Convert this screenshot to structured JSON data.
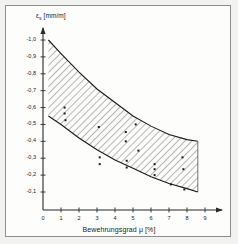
{
  "figure": {
    "background_color": "#f2f2f0",
    "panel_color": "#fdfdfc",
    "border_color": "#8e8e8e"
  },
  "chart_data": {
    "type": "scatter",
    "title": "",
    "subtitle": "",
    "xlabel": "Bewehrungsgrad μ [%]",
    "ylabel": "εs [mm/m]",
    "ylabel_symbol": "ε",
    "ylabel_subscript": "s",
    "ylabel_unit": "[mm/m]",
    "xlabel_text": "Bewehrungsgrad",
    "xlabel_symbol": "μ",
    "xlabel_unit": "[%]",
    "grid": false,
    "legend": "none",
    "xlim": [
      0,
      9.5
    ],
    "ylim": [
      -1.05,
      0
    ],
    "xticks": [
      0,
      1,
      2,
      3,
      4,
      5,
      6,
      7,
      8,
      9
    ],
    "xtick_labels": [
      "0",
      "1",
      "2",
      "3",
      "4",
      "5",
      "6",
      "7",
      "8",
      "9"
    ],
    "yticks": [
      -1.0,
      -0.9,
      -0.8,
      -0.7,
      -0.6,
      -0.5,
      -0.4,
      -0.3,
      -0.2,
      -0.1
    ],
    "ytick_labels": [
      "-1,0",
      "-0,9",
      "-0,8",
      "-0,7",
      "-0,6",
      "-0,5",
      "-0,4",
      "-0,3",
      "-0,2",
      "-0,1"
    ],
    "axis_arrows": true,
    "bands": [
      {
        "name": "scatter-band",
        "fill": "hatched",
        "hatch_angle": 45,
        "hatch_color": "#4a4a4a",
        "upper_curve": [
          [
            0.3,
            -1.0
          ],
          [
            1.0,
            -0.92
          ],
          [
            2.0,
            -0.81
          ],
          [
            3.0,
            -0.71
          ],
          [
            4.0,
            -0.63
          ],
          [
            5.0,
            -0.55
          ],
          [
            6.0,
            -0.49
          ],
          [
            7.0,
            -0.44
          ],
          [
            8.0,
            -0.41
          ],
          [
            8.6,
            -0.4
          ]
        ],
        "lower_curve": [
          [
            0.3,
            -0.55
          ],
          [
            1.0,
            -0.5
          ],
          [
            2.0,
            -0.42
          ],
          [
            3.0,
            -0.35
          ],
          [
            4.0,
            -0.29
          ],
          [
            5.0,
            -0.24
          ],
          [
            6.0,
            -0.19
          ],
          [
            7.0,
            -0.15
          ],
          [
            8.0,
            -0.12
          ],
          [
            8.6,
            -0.1
          ]
        ]
      }
    ],
    "points": [
      [
        1.2,
        -0.6
      ],
      [
        1.2,
        -0.565
      ],
      [
        1.25,
        -0.525
      ],
      [
        3.1,
        -0.485
      ],
      [
        3.15,
        -0.305
      ],
      [
        3.15,
        -0.265
      ],
      [
        4.6,
        -0.455
      ],
      [
        4.6,
        -0.4
      ],
      [
        4.65,
        -0.285
      ],
      [
        4.65,
        -0.245
      ],
      [
        5.15,
        -0.5
      ],
      [
        5.3,
        -0.345
      ],
      [
        6.2,
        -0.265
      ],
      [
        6.2,
        -0.235
      ],
      [
        6.2,
        -0.2
      ],
      [
        7.1,
        -0.145
      ],
      [
        7.75,
        -0.305
      ],
      [
        7.8,
        -0.235
      ],
      [
        7.85,
        -0.115
      ]
    ],
    "point_marker": "square",
    "point_color": "#1a1a1a",
    "point_size": 2.0,
    "curve_color": "#1a1a1a",
    "axis_color": "#2a2a2a"
  }
}
